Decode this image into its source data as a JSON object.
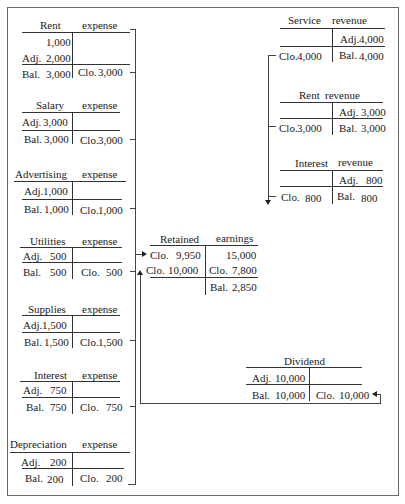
{
  "expenses": [
    {
      "name": "Rent",
      "type": "expense",
      "debits": [
        {
          "label": "",
          "amount": "1,000"
        },
        {
          "label": "Adj.",
          "amount": "2,000"
        }
      ],
      "balance": {
        "label": "Bal.",
        "amount": "3,000"
      },
      "closing": {
        "label": "Clo.",
        "amount": "3,000"
      }
    },
    {
      "name": "Salary",
      "type": "expense",
      "debits": [
        {
          "label": "Adj.",
          "amount": "3,000"
        }
      ],
      "balance": {
        "label": "Bal.",
        "amount": "3,000"
      },
      "closing": {
        "label": "Clo.",
        "amount": "3,000"
      }
    },
    {
      "name": "Advertising",
      "type": "expense",
      "debits": [
        {
          "label": "Adj.",
          "amount": "1,000"
        }
      ],
      "balance": {
        "label": "Bal.",
        "amount": "1,000"
      },
      "closing": {
        "label": "Clo.",
        "amount": "1,000"
      }
    },
    {
      "name": "Utilities",
      "type": "expense",
      "debits": [
        {
          "label": "Adj.",
          "amount": "500"
        }
      ],
      "balance": {
        "label": "Bal.",
        "amount": "500"
      },
      "closing": {
        "label": "Clo.",
        "amount": "500"
      }
    },
    {
      "name": "Supplies",
      "type": "expense",
      "debits": [
        {
          "label": "Adj.",
          "amount": "1,500"
        }
      ],
      "balance": {
        "label": "Bal.",
        "amount": "1,500"
      },
      "closing": {
        "label": "Clo.",
        "amount": "1,500"
      }
    },
    {
      "name": "Interest",
      "type": "expense",
      "debits": [
        {
          "label": "Adj.",
          "amount": "750"
        }
      ],
      "balance": {
        "label": "Bal.",
        "amount": "750"
      },
      "closing": {
        "label": "Clo.",
        "amount": "750"
      }
    },
    {
      "name": "Depreciation",
      "type": "expense",
      "debits": [
        {
          "label": "Adj.",
          "amount": "200"
        }
      ],
      "balance": {
        "label": "Bal.",
        "amount": "200"
      },
      "closing": {
        "label": "Clo.",
        "amount": "200"
      }
    }
  ],
  "revenues": [
    {
      "name": "Service",
      "type": "revenue",
      "credit": {
        "label": "Adj.",
        "amount": "4,000"
      },
      "closing": {
        "label": "Clo.",
        "amount": "4,000"
      },
      "balance": {
        "label": "Bal.",
        "amount": "4,000"
      }
    },
    {
      "name": "Rent",
      "type": "revenue",
      "credit": {
        "label": "Adj.",
        "amount": "3,000"
      },
      "closing": {
        "label": "Clo.",
        "amount": "3,000"
      },
      "balance": {
        "label": "Bal.",
        "amount": "3,000"
      }
    },
    {
      "name": "Interest",
      "type": "revenue",
      "credit": {
        "label": "Adj.",
        "amount": "800"
      },
      "closing": {
        "label": "Clo.",
        "amount": "800"
      },
      "balance": {
        "label": "Bal.",
        "amount": "800"
      }
    }
  ],
  "retained_earnings": {
    "name": "Retained",
    "type": "earnings",
    "debits": [
      {
        "label": "Clo.",
        "amount": "9,950"
      },
      {
        "label": "Clo.",
        "amount": "10,000"
      }
    ],
    "credits": [
      {
        "label": "",
        "amount": "15,000"
      },
      {
        "label": "Clo.",
        "amount": "7,800"
      }
    ],
    "balance": {
      "label": "Bal.",
      "amount": "2,850"
    }
  },
  "dividend": {
    "name": "Dividend",
    "debit": {
      "label": "Adj.",
      "amount": "10,000"
    },
    "balance": {
      "label": "Bal.",
      "amount": "10,000"
    },
    "closing": {
      "label": "Clo.",
      "amount": "10,000"
    }
  }
}
